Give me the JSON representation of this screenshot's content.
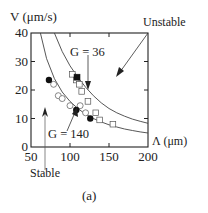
{
  "chart_data": {
    "type": "scatter",
    "panel_label": "(a)",
    "xlabel": "Λ  (μm)",
    "ylabel": "V    (μm/s)",
    "xlim": [
      50,
      200
    ],
    "ylim": [
      0,
      40
    ],
    "x_ticks": [
      "50",
      "100",
      "150",
      "200"
    ],
    "y_ticks": [
      "0",
      "10",
      "20",
      "30",
      "40"
    ],
    "grid": false,
    "annotations": [
      {
        "text": "Unstable",
        "arrow": "pointing down-left into region between/above curves"
      },
      {
        "text": "Stable",
        "arrow": "pointing up"
      },
      {
        "text": "G = 36",
        "arrow": "pointing down to upper curve"
      },
      {
        "text": "G = 140",
        "arrow": "pointing up to lower curve"
      }
    ],
    "curves": [
      {
        "name": "G = 36",
        "description": "upper stability boundary curve",
        "x": [
          80,
          90,
          100,
          110,
          120,
          130,
          140,
          150,
          160,
          170,
          180,
          190,
          200
        ],
        "y": [
          40,
          33.5,
          28.5,
          24.5,
          21,
          18,
          15.5,
          13.5,
          12,
          10.8,
          9.8,
          9,
          8.3
        ]
      },
      {
        "name": "G = 140",
        "description": "lower stability boundary curve",
        "x": [
          62,
          70,
          80,
          90,
          100,
          110,
          120,
          130,
          140,
          150,
          160,
          170,
          180,
          190,
          200
        ],
        "y": [
          40,
          31,
          24,
          19.3,
          16,
          13.5,
          11.5,
          10,
          8.8,
          7.8,
          7,
          6.3,
          5.8,
          5.3,
          4.9
        ]
      }
    ],
    "series": [
      {
        "name": "open squares",
        "marker": "open-square",
        "x": [
          103,
          108,
          112,
          115,
          123,
          133,
          138,
          155
        ],
        "y": [
          25.5,
          23.5,
          22,
          19.5,
          16,
          12,
          9.5,
          8
        ]
      },
      {
        "name": "filled square",
        "marker": "filled-square",
        "x": [
          109
        ],
        "y": [
          24.5
        ]
      },
      {
        "name": "open circles",
        "marker": "open-circle",
        "x": [
          79,
          85,
          90,
          100,
          113,
          120
        ],
        "y": [
          22,
          18,
          17,
          14.5,
          14.5,
          12
        ]
      },
      {
        "name": "filled circles",
        "marker": "filled-circle",
        "x": [
          73,
          108,
          126
        ],
        "y": [
          23.5,
          13,
          10
        ]
      }
    ]
  },
  "labels": {
    "y_axis_title": "V    (μm/s)",
    "x_axis_title": "Λ  (μm)",
    "unstable": "Unstable",
    "stable": "Stable",
    "g36": "G = 36",
    "g140": "G = 140",
    "panel": "(a)"
  }
}
